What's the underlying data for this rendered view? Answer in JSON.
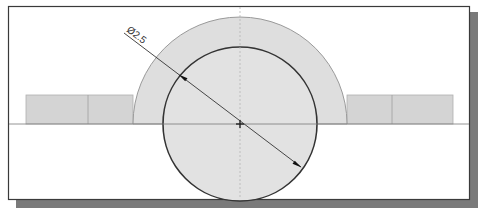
{
  "drawing": {
    "dimension_label": "Ø2.5",
    "colors": {
      "background": "#ffffff",
      "frame": "#3a3a3a",
      "shadow": "#7a7a7a",
      "fill": "#dedede",
      "outline_light": "#9a9a9a",
      "outline_dark": "#333333",
      "centerline": "#8a8a8a"
    }
  }
}
